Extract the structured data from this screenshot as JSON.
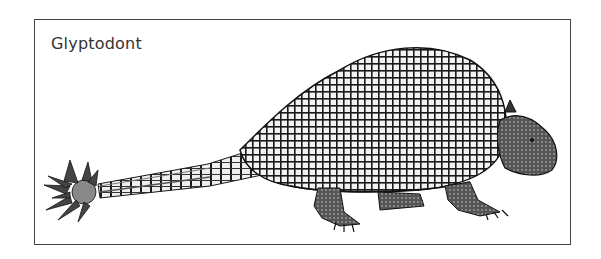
{
  "figure": {
    "title": "Glyptodont",
    "colors": {
      "ink": "#1a1a1a",
      "border": "#444444",
      "background": "#ffffff",
      "shell": "#e8e8e8"
    }
  }
}
